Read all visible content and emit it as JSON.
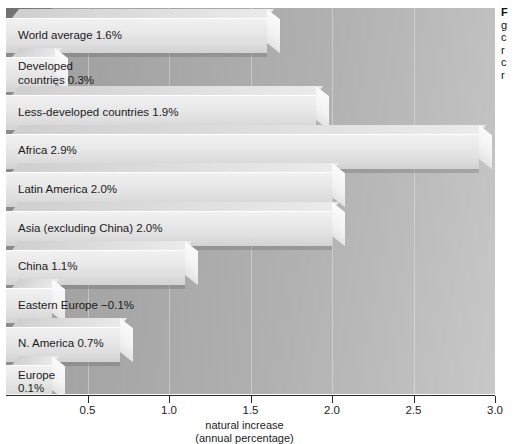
{
  "chart_data": {
    "type": "bar",
    "orientation": "horizontal",
    "title": "",
    "xlabel": "natural increase",
    "xlabel_sub": "(annual percentage)",
    "ylabel": "",
    "xlim": [
      0,
      3.0
    ],
    "xticks": [
      0.5,
      1.0,
      1.5,
      2.0,
      2.5,
      3.0
    ],
    "xtick_labels": [
      "0.5",
      "1.0",
      "1.5",
      "2.0",
      "2.5",
      "3.0"
    ],
    "grid": true,
    "legend": "none",
    "style": "3d-horizontal-bars",
    "categories": [
      "World average",
      "Developed countries",
      "Less-developed countries",
      "Africa",
      "Latin America",
      "Asia (excluding China)",
      "China",
      "Eastern Europe",
      "N. America",
      "Europe"
    ],
    "values": [
      1.6,
      0.3,
      1.9,
      2.9,
      2.0,
      2.0,
      1.1,
      -0.1,
      0.7,
      0.1
    ],
    "bars": [
      {
        "label": "World average 1.6%",
        "name": "World average",
        "value": 1.6,
        "value_text": "1.6%",
        "lines": [
          "World average 1.6%"
        ]
      },
      {
        "label": "Developed countries 0.3%",
        "name": "Developed countries",
        "value": 0.3,
        "value_text": "0.3%",
        "lines": [
          "Developed",
          "countries 0.3%"
        ]
      },
      {
        "label": "Less-developed countries 1.9%",
        "name": "Less-developed countries",
        "value": 1.9,
        "value_text": "1.9%",
        "lines": [
          "Less-developed countries 1.9%"
        ]
      },
      {
        "label": "Africa 2.9%",
        "name": "Africa",
        "value": 2.9,
        "value_text": "2.9%",
        "lines": [
          "Africa 2.9%"
        ]
      },
      {
        "label": "Latin America 2.0%",
        "name": "Latin America",
        "value": 2.0,
        "value_text": "2.0%",
        "lines": [
          "Latin America 2.0%"
        ]
      },
      {
        "label": "Asia (excluding China) 2.0%",
        "name": "Asia (excluding China)",
        "value": 2.0,
        "value_text": "2.0%",
        "lines": [
          "Asia (excluding China) 2.0%"
        ]
      },
      {
        "label": "China 1.1%",
        "name": "China",
        "value": 1.1,
        "value_text": "1.1%",
        "lines": [
          "China 1.1%"
        ]
      },
      {
        "label": "Eastern Europe −0.1%",
        "name": "Eastern Europe",
        "value": -0.1,
        "value_text": "−0.1%",
        "lines": [
          "Eastern Europe  −0.1%"
        ]
      },
      {
        "label": "N. America 0.7%",
        "name": "N. America",
        "value": 0.7,
        "value_text": "0.7%",
        "lines": [
          "N. America 0.7%"
        ]
      },
      {
        "label": "Europe 0.1%",
        "name": "Europe",
        "value": 0.1,
        "value_text": "0.1%",
        "lines": [
          "Europe",
          "0.1%"
        ]
      }
    ]
  },
  "axis": {
    "tick_labels": [
      "0.5",
      "1.0",
      "1.5",
      "2.0",
      "2.5",
      "3.0"
    ],
    "title_line1": "natural increase",
    "title_line2": "(annual percentage)"
  },
  "caption": {
    "head": "F",
    "lines": [
      "g",
      "c",
      "r",
      "c",
      "r"
    ]
  },
  "colors": {
    "panel_dark": "#9d9d9d",
    "panel_light": "#c8c8c8",
    "bar_face": "#e9e9e9",
    "bar_highlight": "#fbfbfb",
    "axis": "#2a2a2a",
    "text": "#1b1b1b"
  }
}
